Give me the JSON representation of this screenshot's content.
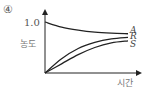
{
  "chart_data": {
    "type": "line",
    "option_label": "④",
    "title": "",
    "xlabel": "시간",
    "ylabel": "농도",
    "ytick_labels": [
      "1.0"
    ],
    "xlim": [
      0,
      1
    ],
    "ylim": [
      0,
      1.2
    ],
    "x": [
      0,
      0.2,
      0.4,
      0.6,
      0.8,
      1.0
    ],
    "series": [
      {
        "name": "A",
        "values": [
          1.0,
          0.9,
          0.84,
          0.8,
          0.78,
          0.77
        ]
      },
      {
        "name": "R",
        "values": [
          0.0,
          0.28,
          0.48,
          0.6,
          0.67,
          0.7
        ]
      },
      {
        "name": "S",
        "values": [
          0.0,
          0.18,
          0.36,
          0.5,
          0.59,
          0.63
        ]
      }
    ],
    "grid": false,
    "legend": "series labels at right end of curves",
    "line_color": "#222222"
  }
}
